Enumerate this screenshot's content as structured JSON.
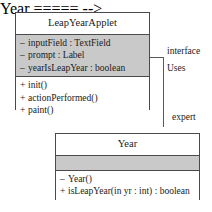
{
  "diagram": {
    "type": "uml-class-diagram",
    "colors": {
      "shaded_compartment": "#c9c9c9",
      "border": "#4a4a4a",
      "connector": "#5a5a5a",
      "text": "#1a1a1a",
      "background": "#ffffff"
    },
    "classes": [
      {
        "id": "leap-year-applet",
        "name": "LeapYearApplet",
        "attributes": [
          {
            "visibility": "–",
            "text": "inputField : TextField"
          },
          {
            "visibility": "–",
            "text": "prompt : Label"
          },
          {
            "visibility": "–",
            "text": "yearIsLeapYear : boolean"
          }
        ],
        "operations": [
          {
            "visibility": "+",
            "text": "init()"
          },
          {
            "visibility": "+",
            "text": "actionPerformed()"
          },
          {
            "visibility": "+",
            "text": "paint()"
          }
        ]
      },
      {
        "id": "year",
        "name": "Year",
        "attributes": [],
        "operations": [
          {
            "visibility": "–",
            "text": "Year()"
          },
          {
            "visibility": "+",
            "text": "isLeapYear(in yr : int) : boolean"
          }
        ]
      }
    ],
    "relationship": {
      "name": "Uses",
      "source_role": "interface",
      "target_role": "expert",
      "source": "LeapYearApplet",
      "target": "Year",
      "arrow": "open-arrowhead"
    }
  }
}
